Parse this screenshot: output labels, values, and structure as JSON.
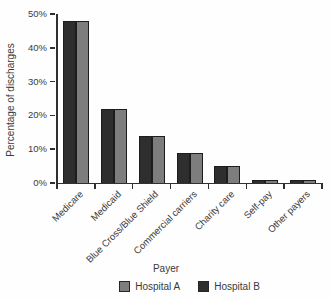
{
  "chart_data": {
    "type": "bar",
    "title": "",
    "xlabel": "Payer",
    "ylabel": "Percentage of discharges",
    "categories": [
      "Medicare",
      "Medicaid",
      "Blue Cross/Blue Shield",
      "Commercial carriers",
      "Charity care",
      "Self-pay",
      "Other payers"
    ],
    "series": [
      {
        "name": "Hospital B",
        "color": "#2e2e2e",
        "values": [
          48,
          22,
          14,
          9,
          5,
          1,
          1
        ]
      },
      {
        "name": "Hospital A",
        "color": "#7d7d7d",
        "values": [
          48,
          22,
          14,
          9,
          5,
          1,
          1
        ]
      }
    ],
    "legend": {
      "position": "bottom",
      "items": [
        {
          "label": "Hospital A",
          "color": "#7d7d7d"
        },
        {
          "label": "Hospital B",
          "color": "#2e2e2e"
        }
      ]
    },
    "ylim": [
      0,
      50
    ],
    "yticks": [
      {
        "label": "0%",
        "value": 0
      },
      {
        "label": "10%",
        "value": 10
      },
      {
        "label": "20%",
        "value": 20
      },
      {
        "label": "30%",
        "value": 30
      },
      {
        "label": "40%",
        "value": 40
      },
      {
        "label": "50%",
        "value": 50
      }
    ],
    "grid": false
  }
}
